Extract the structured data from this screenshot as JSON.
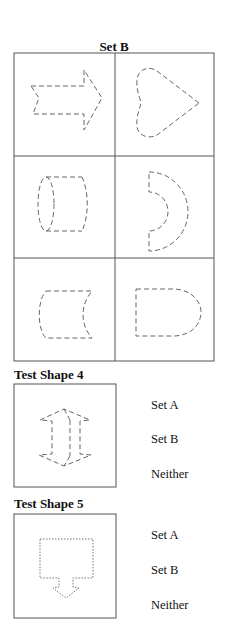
{
  "set": {
    "title": "Set B",
    "cells": [
      {
        "shape": "right-arrow",
        "row": 1,
        "col": 1
      },
      {
        "shape": "heart-pointing-right",
        "row": 1,
        "col": 2
      },
      {
        "shape": "cylinder",
        "row": 2,
        "col": 1
      },
      {
        "shape": "half-annulus",
        "row": 2,
        "col": 2
      },
      {
        "shape": "concave-right-rectangle",
        "row": 3,
        "col": 1
      },
      {
        "shape": "d-shape",
        "row": 3,
        "col": 2
      }
    ],
    "line_color": "#555555",
    "shape_stroke_color": "#666666"
  },
  "tests": [
    {
      "label": "Test Shape 4",
      "shape": "double-arrow-prism",
      "stroke_style": "dashed",
      "options": [
        "Set A",
        "Set B",
        "Neither"
      ]
    },
    {
      "label": "Test Shape 5",
      "shape": "square-with-down-arrow",
      "stroke_style": "dotted",
      "options": [
        "Set A",
        "Set B",
        "Neither"
      ]
    }
  ]
}
